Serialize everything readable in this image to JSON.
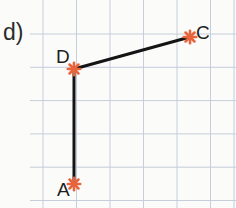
{
  "figure": {
    "panel_label": "d)",
    "background_color": "#fbfbfa",
    "width": 236,
    "height": 208
  },
  "grid": {
    "line_color": "#c6cedb",
    "line_width": 1,
    "spacing": 33.3,
    "x_lines": [
      43,
      76.5,
      110,
      143.5,
      177,
      210.5,
      234
    ],
    "y_lines": [
      34,
      67.3,
      100.6,
      133.9,
      167.2,
      200.5
    ]
  },
  "chart_data": {
    "type": "scatter",
    "title": "d)",
    "xlabel": "",
    "ylabel": "",
    "marker_color": "#e8643c",
    "segment_color": "#141414",
    "segment_width": 3,
    "points": [
      {
        "name": "A",
        "x": 74,
        "y": 184,
        "label": "A",
        "label_position": "left"
      },
      {
        "name": "D",
        "x": 74,
        "y": 69,
        "label": "D",
        "label_position": "above-left"
      },
      {
        "name": "C",
        "x": 190,
        "y": 37,
        "label": "C",
        "label_position": "right"
      }
    ],
    "segments": [
      {
        "name": "segment-A-D",
        "from": "A",
        "to": "D"
      },
      {
        "name": "segment-D-C",
        "from": "D",
        "to": "C"
      }
    ]
  },
  "labels": {
    "A": "A",
    "C": "C",
    "D": "D"
  }
}
